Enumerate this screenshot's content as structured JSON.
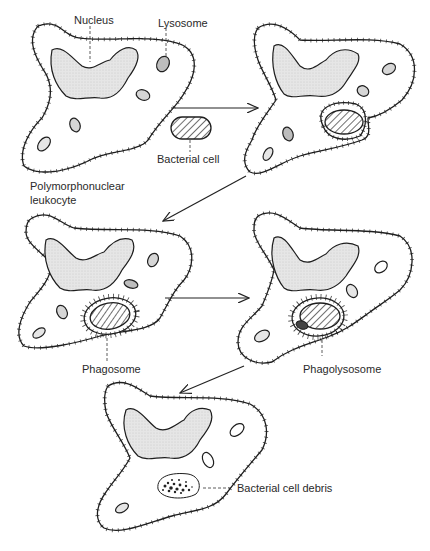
{
  "diagram": {
    "type": "process-flow",
    "labels": {
      "nucleus": "Nucleus",
      "lysosome": "Lysosome",
      "bacterial_cell": "Bacterial cell",
      "cell_type_line1": "Polymorphonuclear",
      "cell_type_line2": "leukocyte",
      "phagosome": "Phagosome",
      "phagolysosome": "Phagolysosome",
      "debris": "Bacterial cell debris"
    },
    "stages": [
      {
        "id": 1,
        "description": "Leukocyte approaches bacterial cell"
      },
      {
        "id": 2,
        "description": "Cell membrane engulfs bacterium"
      },
      {
        "id": 3,
        "description": "Phagosome formed"
      },
      {
        "id": 4,
        "description": "Lysosome fuses forming phagolysosome"
      },
      {
        "id": 5,
        "description": "Bacterial cell digested to debris"
      }
    ],
    "colors": {
      "outline": "#1e1e1e",
      "nucleus_fill": "#e2e2e2",
      "lysosome_fill": "#cfcfcf",
      "background": "#ffffff"
    }
  }
}
